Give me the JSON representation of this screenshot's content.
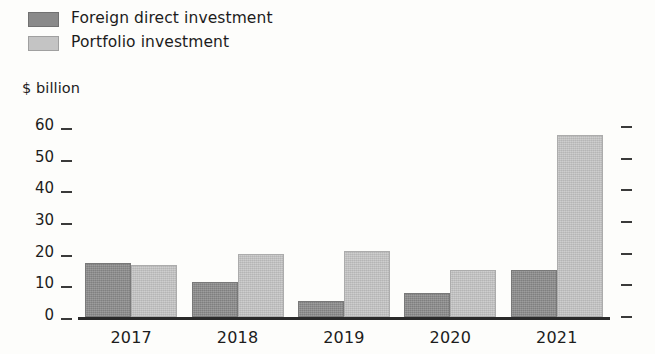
{
  "legend": {
    "items": [
      {
        "label": "Foreign direct investment",
        "color": "#8a8a8a",
        "key": "fdi"
      },
      {
        "label": "Portfolio investment",
        "color": "#c4c4c4",
        "key": "portfolio"
      }
    ]
  },
  "axis": {
    "y_title": "$ billion",
    "y_ticks": [
      "60",
      "50",
      "40",
      "30",
      "20",
      "10",
      "0"
    ],
    "x_ticks": [
      "2017",
      "2018",
      "2019",
      "2020",
      "2021"
    ]
  },
  "chart_data": {
    "type": "bar",
    "title": "",
    "subtitle": "",
    "xlabel": "",
    "ylabel": "$ billion",
    "ylim": [
      0,
      60
    ],
    "yticks": [
      0,
      10,
      20,
      30,
      40,
      50,
      60
    ],
    "grid": false,
    "legend_position": "top-left",
    "categories": [
      "2017",
      "2018",
      "2019",
      "2020",
      "2021"
    ],
    "series": [
      {
        "name": "Foreign direct investment",
        "color": "#8a8a8a",
        "values": [
          17,
          11,
          5,
          7.5,
          15
        ]
      },
      {
        "name": "Portfolio investment",
        "color": "#c4c4c4",
        "values": [
          16.5,
          20,
          21,
          15,
          57.5
        ]
      }
    ],
    "annotations": [],
    "right_axis_ticks_unlabeled": 7
  }
}
